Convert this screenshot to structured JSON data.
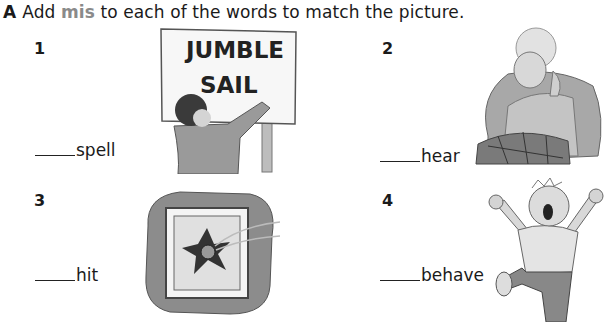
{
  "instruction": {
    "letter": "A",
    "before": "Add",
    "highlight": "mis",
    "after": "to each of the words to match the picture.",
    "highlight_color": "#8a8a8a"
  },
  "items": [
    {
      "number": "1",
      "word": "spell",
      "picture": "boy-writing-jumble-sail-sign",
      "sign_text": [
        "JUMBLE",
        "SAIL"
      ]
    },
    {
      "number": "2",
      "word": "hear",
      "picture": "grandmother-cupping-ear"
    },
    {
      "number": "3",
      "word": "hit",
      "picture": "ball-through-window"
    },
    {
      "number": "4",
      "word": "behave",
      "picture": "boy-tantrum"
    }
  ]
}
